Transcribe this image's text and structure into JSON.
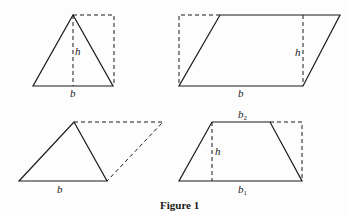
{
  "figure": {
    "caption": "Figure 1",
    "panels": [
      {
        "id": "triangle-in-rectangle",
        "labels": {
          "height": "h",
          "base": "b"
        }
      },
      {
        "id": "parallelogram-in-rectangle",
        "labels": {
          "height": "h",
          "base": "b"
        }
      },
      {
        "id": "triangle-half-parallelogram",
        "labels": {
          "base": "b"
        }
      },
      {
        "id": "trapezoid",
        "labels": {
          "height": "h",
          "top_base": "b",
          "top_base_sub": "2",
          "bottom_base": "b",
          "bottom_base_sub": "1"
        }
      }
    ]
  }
}
